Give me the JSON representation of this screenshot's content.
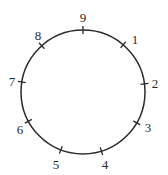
{
  "diagram": {
    "type": "circle-with-ticks",
    "circle": {
      "cx": 83,
      "cy": 92,
      "r": 62,
      "stroke": "#2a2a2a"
    },
    "ticks": [
      {
        "label": "9",
        "x": 83,
        "y": 30,
        "lx": 83,
        "ly": 22
      },
      {
        "label": "1",
        "x": 123,
        "y": 45,
        "lx": 135,
        "ly": 44
      },
      {
        "label": "2",
        "x": 144,
        "y": 84,
        "lx": 155,
        "ly": 88
      },
      {
        "label": "3",
        "x": 137,
        "y": 123,
        "lx": 148,
        "ly": 132
      },
      {
        "label": "4",
        "x": 102,
        "y": 153,
        "lx": 105,
        "ly": 169
      },
      {
        "label": "5",
        "x": 60,
        "y": 152,
        "lx": 56,
        "ly": 169
      },
      {
        "label": "6",
        "x": 27,
        "y": 122,
        "lx": 20,
        "ly": 134
      },
      {
        "label": "7",
        "x": 22,
        "y": 82,
        "lx": 12,
        "ly": 86
      },
      {
        "label": "8",
        "x": 41,
        "y": 45,
        "lx": 38,
        "ly": 40
      }
    ]
  }
}
